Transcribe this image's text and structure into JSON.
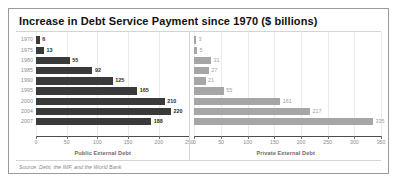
{
  "chart_data": {
    "type": "bar",
    "orientation": "horizontal",
    "title": "Increase in Debt Service Payment since 1970 ($ billions)",
    "source_note": "Source: Debt, the IMF, and the World Bank",
    "categories": [
      "1970",
      "1975",
      "1980",
      "1985",
      "1990",
      "1995",
      "2000",
      "2004",
      "2007"
    ],
    "grid": true,
    "legend": "none",
    "panels": [
      {
        "key": "public",
        "xlabel": "Public External Debt",
        "series_name": "Public External Debt",
        "color": "#3a3a3a",
        "values": [
          6,
          13,
          55,
          92,
          125,
          165,
          210,
          220,
          188
        ],
        "xlim": [
          0,
          250
        ],
        "ticks": [
          0,
          50,
          100,
          150,
          200,
          250
        ],
        "tick_labels": [
          "0",
          "50",
          "100",
          "150",
          "200",
          "250"
        ]
      },
      {
        "key": "private",
        "xlabel": "Private External Debt",
        "series_name": "Private External Debt",
        "color": "#a6a6a6",
        "values": [
          3,
          5,
          31,
          27,
          21,
          55,
          161,
          217,
          335
        ],
        "xlim": [
          0,
          350
        ],
        "ticks": [
          0,
          50,
          100,
          150,
          200,
          250,
          300,
          350
        ],
        "tick_labels": [
          "0",
          "50",
          "100",
          "150",
          "200",
          "250",
          "300",
          "350"
        ]
      }
    ]
  }
}
